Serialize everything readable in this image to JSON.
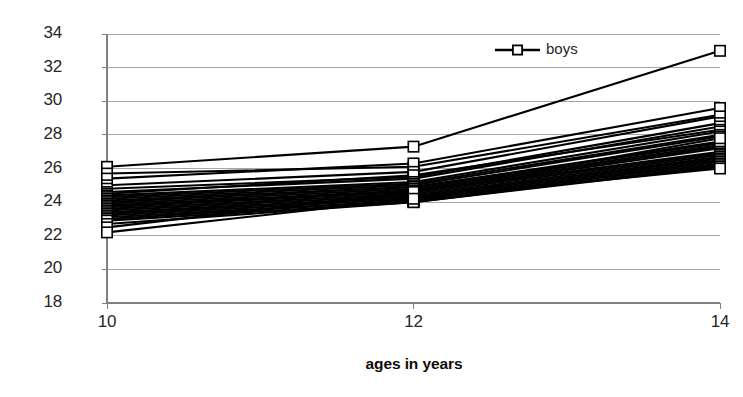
{
  "chart_data": {
    "type": "line",
    "title": "",
    "xlabel": "ages in years",
    "ylabel": "dental measurement in mm",
    "x": [
      10,
      12,
      14
    ],
    "xtick_labels": [
      "10",
      "12",
      "14"
    ],
    "ytick_labels": [
      "34",
      "32",
      "30",
      "28",
      "26",
      "24",
      "22",
      "20",
      "18"
    ],
    "ylim": [
      18,
      34
    ],
    "xlim": [
      10,
      14
    ],
    "ytick_step": 2,
    "grid": "horizontal",
    "legend": {
      "entries": [
        "boys"
      ],
      "position": "top-right-inside",
      "marker": "open-square"
    },
    "marker": "open-square",
    "line_color": "#000000",
    "grid_color": "#a6a6a6",
    "axis_color": "#808080",
    "series": [
      {
        "name": "boy01",
        "values": [
          26.0,
          25.0,
          29.0
        ]
      },
      {
        "name": "boy02",
        "values": [
          21.5,
          22.5,
          26.5
        ]
      },
      {
        "name": "boy03",
        "values": [
          23.0,
          22.5,
          26.0
        ]
      },
      {
        "name": "boy04",
        "values": [
          25.5,
          27.5,
          26.5
        ]
      },
      {
        "name": "boy05",
        "values": [
          20.0,
          23.5,
          25.0
        ]
      },
      {
        "name": "boy06",
        "values": [
          24.5,
          25.5,
          26.5
        ]
      },
      {
        "name": "boy07",
        "values": [
          22.0,
          22.0,
          23.5
        ]
      },
      {
        "name": "boy08",
        "values": [
          24.0,
          21.5,
          25.5
        ]
      },
      {
        "name": "boy09",
        "values": [
          23.0,
          20.5,
          26.0
        ]
      },
      {
        "name": "boy10",
        "values": [
          27.5,
          28.0,
          31.0
        ]
      },
      {
        "name": "boy11",
        "values": [
          23.0,
          23.0,
          23.5
        ]
      },
      {
        "name": "boy12",
        "values": [
          21.5,
          23.5,
          24.0
        ]
      },
      {
        "name": "boy13",
        "values": [
          17.0,
          24.5,
          26.0
        ]
      },
      {
        "name": "boy14",
        "values": [
          22.5,
          25.5,
          26.0
        ]
      },
      {
        "name": "boy15",
        "values": [
          23.0,
          24.5,
          26.0
        ]
      },
      {
        "name": "boy16",
        "values": [
          22.0,
          21.5,
          23.5
        ]
      },
      {
        "name": "boy17",
        "values": [
          21.0,
          21.0,
          22.5
        ]
      },
      {
        "name": "boy18",
        "values": [
          19.0,
          19.0,
          19.0
        ]
      },
      {
        "name": "boy19",
        "values": [
          25.0,
          25.0,
          28.0
        ]
      },
      {
        "name": "boy20",
        "values": [
          25.0,
          24.5,
          27.0
        ]
      },
      {
        "name": "boy21",
        "values": [
          27.5,
          26.5,
          27.0
        ]
      },
      {
        "name": "boy22",
        "values": [
          23.5,
          24.5,
          27.0
        ]
      },
      {
        "name": "boy23",
        "values": [
          21.5,
          23.5,
          25.0
        ]
      },
      {
        "name": "boy24",
        "values": [
          17.0,
          17.0,
          23.5
        ]
      },
      {
        "name": "boy25",
        "values": [
          23.0,
          24.5,
          27.5
        ]
      },
      {
        "name": "boy26",
        "values": [
          22.0,
          21.5,
          24.5
        ]
      },
      {
        "name": "boy27",
        "values": [
          21.5,
          23.5,
          25.5
        ]
      }
    ],
    "plotted_lines": [
      [
        26.1,
        27.3,
        33.0
      ],
      [
        25.7,
        26.1,
        29.2
      ],
      [
        25.4,
        26.3,
        29.6
      ],
      [
        25.0,
        25.8,
        29.1
      ],
      [
        24.8,
        25.5,
        28.7
      ],
      [
        24.6,
        25.4,
        28.5
      ],
      [
        24.5,
        25.6,
        28.3
      ],
      [
        24.4,
        25.2,
        28.2
      ],
      [
        24.3,
        25.1,
        28.0
      ],
      [
        24.2,
        25.0,
        27.9
      ],
      [
        24.1,
        24.9,
        27.6
      ],
      [
        24.0,
        24.9,
        27.5
      ],
      [
        23.9,
        24.8,
        27.4
      ],
      [
        23.8,
        24.7,
        27.3
      ],
      [
        23.8,
        24.6,
        27.2
      ],
      [
        23.7,
        24.6,
        27.0
      ],
      [
        23.6,
        24.5,
        26.9
      ],
      [
        23.5,
        24.4,
        26.8
      ],
      [
        23.4,
        24.3,
        26.7
      ],
      [
        23.3,
        24.3,
        26.6
      ],
      [
        23.2,
        24.2,
        26.5
      ],
      [
        23.1,
        24.1,
        26.4
      ],
      [
        23.0,
        24.1,
        26.3
      ],
      [
        22.9,
        24.0,
        26.2
      ],
      [
        22.7,
        24.0,
        26.1
      ],
      [
        22.5,
        24.6,
        27.8
      ],
      [
        22.2,
        24.2,
        26.0
      ]
    ]
  }
}
